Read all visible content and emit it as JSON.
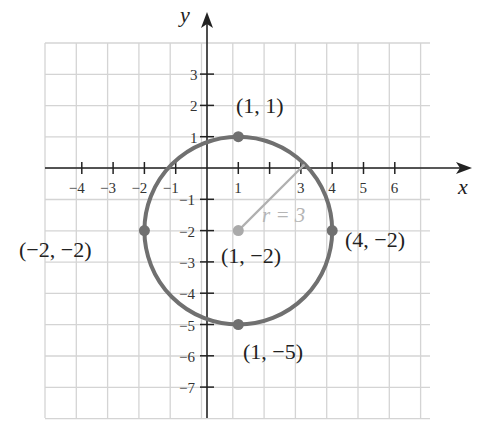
{
  "chart_data": {
    "type": "scatter",
    "title": "",
    "xlabel": "x",
    "ylabel": "y",
    "xlim": [
      -5,
      7.3
    ],
    "ylim": [
      -8,
      4
    ],
    "grid": true,
    "x_tick_labels": [
      "−4",
      "−3",
      "−2",
      "−1",
      "1",
      "3",
      "4",
      "5",
      "6"
    ],
    "x_tick_values": [
      -4,
      -3,
      -2,
      -1,
      1,
      3,
      4,
      5,
      6
    ],
    "y_tick_labels": [
      "3",
      "2",
      "1",
      "−1",
      "−2",
      "−3",
      "−4",
      "−5",
      "−6",
      "−7"
    ],
    "y_tick_values": [
      3,
      2,
      1,
      -1,
      -2,
      -3,
      -4,
      -5,
      -6,
      -7
    ],
    "circle": {
      "center": [
        1,
        -2
      ],
      "radius": 3,
      "color": "#707070"
    },
    "radius_label": "r = 3",
    "radius_segment": {
      "from": [
        1,
        -2
      ],
      "to": [
        3.12,
        0.12
      ],
      "color": "#b0b0b0"
    },
    "points": [
      {
        "x": 1,
        "y": 1,
        "label": "(1, 1)",
        "color": "#707070"
      },
      {
        "x": -2,
        "y": -2,
        "label": "(−2, −2)",
        "color": "#707070"
      },
      {
        "x": 4,
        "y": -2,
        "label": "(4, −2)",
        "color": "#707070"
      },
      {
        "x": 1,
        "y": -5,
        "label": "(1, −5)",
        "color": "#707070"
      },
      {
        "x": 1,
        "y": -2,
        "label": "(1, −2)",
        "color": "#aaaaaa"
      }
    ]
  },
  "labels": {
    "x_axis": "x",
    "y_axis": "y",
    "radius": "r = 3",
    "p_top": "(1, 1)",
    "p_left": "(−2, −2)",
    "p_right": "(4, −2)",
    "p_bottom": "(1, −5)",
    "p_center": "(1, −2)",
    "xt": [
      "−4",
      "−3",
      "−2",
      "−1",
      "1",
      "3",
      "4",
      "5",
      "6"
    ],
    "yt": [
      "3",
      "2",
      "1",
      "−1",
      "−2",
      "−3",
      "−4",
      "−5",
      "−6",
      "−7"
    ]
  }
}
